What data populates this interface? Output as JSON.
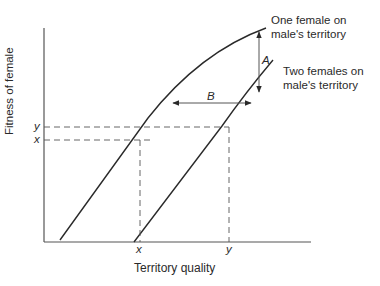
{
  "diagram": {
    "x_axis_label": "Territory quality",
    "y_axis_label": "Fitness of female",
    "curves": [
      {
        "label_line1": "One female on",
        "label_line2": "male's territory"
      },
      {
        "label_line1": "Two females on",
        "label_line2": "male's territory"
      }
    ],
    "arrows": {
      "vertical": "A",
      "horizontal": "B"
    },
    "y_ticks": {
      "upper": "y",
      "lower": "x"
    },
    "x_ticks": {
      "left": "x",
      "right": "y"
    }
  }
}
